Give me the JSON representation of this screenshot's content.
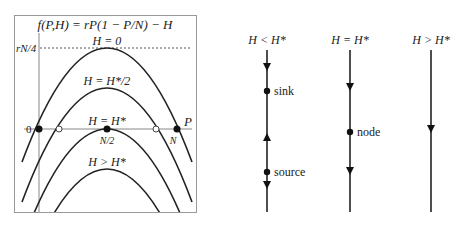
{
  "left_panel": {
    "title": "f(P,H) = rP(1 − P/N) − H",
    "y_tick": "rN/4",
    "x_axis_label": "P",
    "origin_label": "0",
    "x_ticks": {
      "half": "N/2",
      "full": "N"
    },
    "curves": [
      {
        "label": "H = 0",
        "peak_y": 48
      },
      {
        "label": "H = H*/2",
        "peak_y": 88
      },
      {
        "label": "H = H*",
        "peak_y": 129
      },
      {
        "label": "H > H*",
        "peak_y": 169
      }
    ]
  },
  "right_panel": {
    "columns": [
      {
        "header": "H < H*",
        "points": [
          {
            "label": "sink",
            "type": "filled"
          },
          {
            "label": "source",
            "type": "filled"
          }
        ]
      },
      {
        "header": "H = H*",
        "points": [
          {
            "label": "node",
            "type": "filled"
          }
        ]
      },
      {
        "header": "H > H*",
        "points": []
      }
    ]
  }
}
